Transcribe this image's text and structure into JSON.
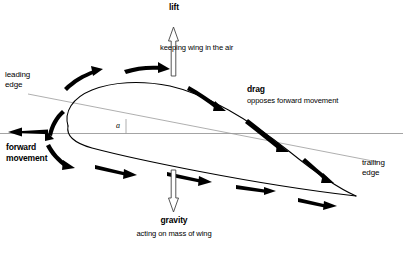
{
  "diagram": {
    "background_color": "#ffffff",
    "stroke_color": "#000000",
    "thin_line_color": "#9a9a9a",
    "labels": {
      "lift": "lift",
      "lift_sub": "keeping wing in the air",
      "gravity": "gravity",
      "gravity_sub": "acting on mass of wing",
      "drag": "drag",
      "drag_sub": "opposes forward movement",
      "forward_movement_line1": "forward",
      "forward_movement_line2": "movement",
      "leading_edge_line1": "leading",
      "leading_edge_line2": "edge",
      "trailing_edge_line1": "trailing",
      "trailing_edge_line2": "edge",
      "angle_of_attack": "a"
    },
    "arrows": {
      "lift_direction": "up",
      "gravity_direction": "down",
      "forward_movement_direction": "left",
      "airflow_upper_count": 5,
      "airflow_lower_count": 4
    }
  }
}
